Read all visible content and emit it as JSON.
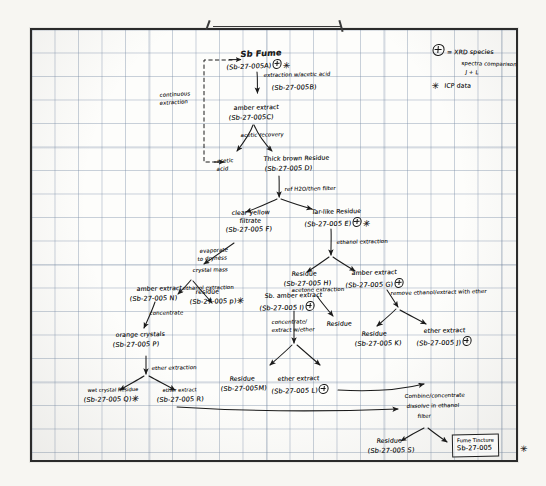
{
  "document": {
    "title": "Sb Fume Extraction Scheme",
    "medium": "hand-drawn flowchart on graph paper"
  },
  "legend": {
    "xrd_symbol": "⊕",
    "xrd_text": "= XRD species",
    "spectra_note_line1": "spectra comparison",
    "spectra_note_line2": "J + L",
    "icp_symbol": "✳",
    "icp_text": "ICP data"
  },
  "side_notes": {
    "continuous_extraction": "continuous\nextraction",
    "acetic_acid": "acetic\nacid"
  },
  "nodes": [
    {
      "id": "A",
      "name": "Sb Fume",
      "code": "(Sb-27-005A)",
      "xrd": true,
      "icp": true
    },
    {
      "id": "B",
      "name": "",
      "code": "(Sb-27-005B)",
      "xrd": false,
      "icp": false
    },
    {
      "id": "C",
      "name": "amber extract",
      "code": "(Sb-27-005C)",
      "xrd": false,
      "icp": false
    },
    {
      "id": "D",
      "name": "Thick brown residue",
      "code": "(Sb-27-005D)",
      "xrd": false,
      "icp": false
    },
    {
      "id": "F",
      "name": "clear yellow filtrate",
      "code": "(Sb-27-005F)",
      "xrd": false,
      "icp": false
    },
    {
      "id": "E",
      "name": "Tar-like residue",
      "code": "(Sb-27-005E)",
      "xrd": true,
      "icp": true
    },
    {
      "id": "H",
      "name": "Residue",
      "code": "(Sb-27-005H)",
      "xrd": false,
      "icp": false
    },
    {
      "id": "G",
      "name": "amber extract",
      "code": "(Sb-27-005G)",
      "xrd": true,
      "icp": false
    },
    {
      "id": "N",
      "name": "amber extract",
      "code": "(Sb-27-005N)",
      "xrd": false,
      "icp": false
    },
    {
      "id": "P2",
      "name": "residue",
      "code": "(Sb-27-005P)",
      "xrd": false,
      "icp": true
    },
    {
      "id": "P",
      "name": "orange crystals",
      "code": "(Sb-27-005 P)",
      "xrd": false,
      "icp": false
    },
    {
      "id": "I",
      "name": "Sb. amber extract",
      "code": "(Sb-27-005 I)",
      "xrd": true,
      "icp": false
    },
    {
      "id": "K",
      "name": "Residue",
      "code": "(Sb-27-005K)",
      "xrd": false,
      "icp": false
    },
    {
      "id": "J",
      "name": "ether extract",
      "code": "(Sb-27-005J)",
      "xrd": true,
      "icp": false
    },
    {
      "id": "Q",
      "name": "wet crystal residue",
      "code": "(Sb-27-005 Q)",
      "xrd": false,
      "icp": true
    },
    {
      "id": "R",
      "name": "ether extract",
      "code": "(Sb-27-005 R)",
      "xrd": false,
      "icp": false
    },
    {
      "id": "M",
      "name": "Residue",
      "code": "(Sb-27-005M)",
      "xrd": false,
      "icp": false
    },
    {
      "id": "L",
      "name": "ether extract",
      "code": "(Sb-27-005 L)",
      "xrd": true,
      "icp": false
    },
    {
      "id": "S",
      "name": "Residue",
      "code": "(Sb-27-005S)",
      "xrd": false,
      "icp": false
    }
  ],
  "node_text": {
    "A_name": "Sb Fume",
    "A_code": "(Sb-27-005A)",
    "B_code": "(Sb-27-005B)",
    "C_name": "amber extract",
    "C_code": "(Sb-27-005C)",
    "D_name": "Thick brown Residue",
    "D_code": "(Sb-27-005 D)",
    "F_name1": "clear yellow",
    "F_name2": "filtrate",
    "F_code": "(Sb-27-005 F)",
    "E_name": "Tar-like Residue",
    "E_code": "(Sb-27-005 E)",
    "H_name": "Residue",
    "H_code": "(Sb-27-005 H)",
    "G_name": "amber extract",
    "G_code": "(Sb-27-005 G)",
    "N_name": "amber extract",
    "N_code": "(Sb-27-005 N)",
    "P2_name": "residue",
    "P2_code": "(Sb-27-005 p)",
    "P_name": "orange crystals",
    "P_code": "(Sb-27-005 P)",
    "I_name": "Sb. amber extract",
    "I_code": "(Sb-27-005 I)",
    "K_name": "Residue",
    "K_code": "(Sb-27-005 K)",
    "J_name": "ether extract",
    "J_code": "(Sb-27-005 J)",
    "Q_name": "wet crystal Residue",
    "Q_code": "(Sb-27-005 Q)",
    "R_name": "ether extract",
    "R_code": "(Sb-27-005 R)",
    "M_name": "Residue",
    "M_code": "(Sb-27-005M)",
    "L_name": "ether extract",
    "L_code": "(Sb-27-005 L)",
    "S_name": "Residue",
    "S_code": "(Sb-27-005 S)",
    "residue_mid": "Residue"
  },
  "process_labels": {
    "extraction_acetic": "extraction w/acetic acid",
    "acetic_recovery": "acetic recovery",
    "ref_h2o_filter": "ref H2O/then filter",
    "ethanol_extraction_right": "ethanol extraction",
    "evaporate_to_dryness1": "evaporate",
    "evaporate_to_dryness2": "to dryness",
    "crystal_mass": "crystal mass",
    "ethanol_extraction_left": "ethanol extraction",
    "concentrate": "concentrate",
    "ether_extraction": "ether extraction",
    "remove_ethanol": "remove ethanol/extract with ether",
    "acetone_extraction": "acetone extraction",
    "concentrate_extract1": "concentrate/",
    "concentrate_extract2": "extract w/ether",
    "combine1": "Combine/concentrate",
    "combine2": "dissolve in ethanol",
    "combine3": "filter"
  },
  "final_product": {
    "label_line1": "Fume Tincture",
    "label_line2": "Sb-27-005",
    "icp_symbol": "✳"
  }
}
